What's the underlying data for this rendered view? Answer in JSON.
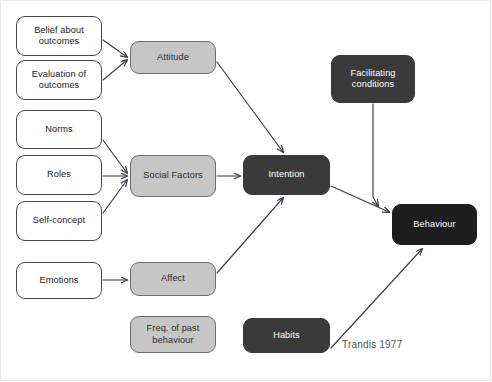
{
  "diagram": {
    "citation": "Trandis 1977",
    "colors": {
      "white_node_fill": "#ffffff",
      "white_node_border": "#4a4a4a",
      "grey_node_fill": "#c6c6c6",
      "grey_node_border": "#6d6d6d",
      "dark_node_fill": "#3a3a3a",
      "black_node_fill": "#1d1d1d",
      "edge_stroke": "#3b3b4a",
      "label_dark": "#222222",
      "label_light": "#ffffff",
      "citation_color": "#555555",
      "frame_border": "#e9e9e9",
      "background": "#ffffff"
    },
    "nodes": [
      {
        "id": "belief_about_outcomes",
        "label": "Belief about outcomes",
        "style": "white",
        "x": 16,
        "y": 16,
        "w": 86,
        "h": 40
      },
      {
        "id": "evaluation_of_outcomes",
        "label": "Evaluation of outcomes",
        "style": "white",
        "x": 16,
        "y": 60,
        "w": 86,
        "h": 40
      },
      {
        "id": "norms",
        "label": "Norms",
        "style": "white",
        "x": 16,
        "y": 110,
        "w": 86,
        "h": 39
      },
      {
        "id": "roles",
        "label": "Roles",
        "style": "white",
        "x": 16,
        "y": 155,
        "w": 86,
        "h": 40
      },
      {
        "id": "self_concept",
        "label": "Self-concept",
        "style": "white",
        "x": 16,
        "y": 201,
        "w": 86,
        "h": 40
      },
      {
        "id": "emotions",
        "label": "Emotions",
        "style": "white",
        "x": 16,
        "y": 262,
        "w": 86,
        "h": 37
      },
      {
        "id": "attitude",
        "label": "Attitude",
        "style": "grey",
        "x": 130,
        "y": 41,
        "w": 86,
        "h": 33
      },
      {
        "id": "social_factors",
        "label": "Social Factors",
        "style": "grey",
        "x": 130,
        "y": 155,
        "w": 86,
        "h": 42
      },
      {
        "id": "affect",
        "label": "Affect",
        "style": "grey",
        "x": 130,
        "y": 262,
        "w": 86,
        "h": 34
      },
      {
        "id": "freq_of_past_behaviour",
        "label": "Freq. of past behaviour",
        "style": "grey",
        "x": 130,
        "y": 316,
        "w": 86,
        "h": 37
      },
      {
        "id": "facilitating_conditions",
        "label": "Facilitating conditions",
        "style": "dark",
        "x": 331,
        "y": 55,
        "w": 84,
        "h": 48
      },
      {
        "id": "intention",
        "label": "Intention",
        "style": "dark",
        "x": 243,
        "y": 155,
        "w": 87,
        "h": 40
      },
      {
        "id": "habits",
        "label": "Habits",
        "style": "dark",
        "x": 243,
        "y": 318,
        "w": 87,
        "h": 35
      },
      {
        "id": "behaviour",
        "label": "Behaviour",
        "style": "black",
        "x": 392,
        "y": 204,
        "w": 85,
        "h": 41
      }
    ],
    "edges": [
      {
        "id": "belief-to-attitude",
        "from": "belief_about_outcomes",
        "to": "attitude",
        "path": "M103,40 L127,57"
      },
      {
        "id": "evaluation-to-attitude",
        "from": "evaluation_of_outcomes",
        "to": "attitude",
        "path": "M103,80 L127,60"
      },
      {
        "id": "norms-to-social-factors",
        "from": "norms",
        "to": "social_factors",
        "path": "M103,140 L127,173"
      },
      {
        "id": "roles-to-social-factors",
        "from": "roles",
        "to": "social_factors",
        "path": "M103,176 L127,176"
      },
      {
        "id": "self-concept-to-social-factors",
        "from": "self_concept",
        "to": "social_factors",
        "path": "M103,213 L127,180"
      },
      {
        "id": "emotions-to-affect",
        "from": "emotions",
        "to": "affect",
        "path": "M103,280 L127,280"
      },
      {
        "id": "attitude-to-intention",
        "from": "attitude",
        "to": "intention",
        "path": "M217,62 L283,152"
      },
      {
        "id": "social-factors-to-intention",
        "from": "social_factors",
        "to": "intention",
        "path": "M217,176 L240,176"
      },
      {
        "id": "affect-to-intention",
        "from": "affect",
        "to": "intention",
        "path": "M217,273 L283,198"
      },
      {
        "id": "intention-to-behaviour",
        "from": "intention",
        "to": "behaviour",
        "path": "M331,186 L389,212"
      },
      {
        "id": "facilitating-conditions-to-behaviour",
        "from": "facilitating_conditions",
        "to": "behaviour",
        "path": "M373,104 L373,197 L378,206"
      },
      {
        "id": "habits-to-behaviour",
        "from": "habits",
        "to": "behaviour",
        "path": "M331,348 L422,249"
      }
    ]
  }
}
